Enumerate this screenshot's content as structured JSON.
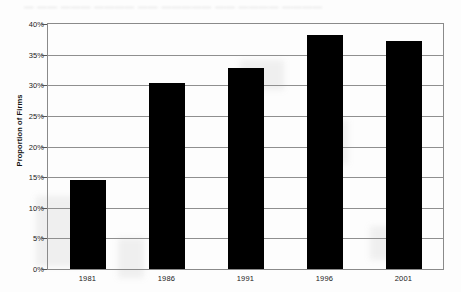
{
  "artifacts": {
    "bleed_through_text": "— —— ——— ———— —— ————— —— ———— ————"
  },
  "chart_data": {
    "type": "bar",
    "title": "",
    "xlabel": "",
    "ylabel": "Proportion of Firms",
    "categories": [
      "1981",
      "1986",
      "1991",
      "1996",
      "2001"
    ],
    "values": [
      14.5,
      30.3,
      32.8,
      38.2,
      37.2
    ],
    "value_unit": "%",
    "ylim": [
      0,
      40
    ],
    "ytick_values": [
      0,
      5,
      10,
      15,
      20,
      25,
      30,
      35,
      40
    ],
    "ytick_labels": [
      "0%",
      "5%",
      "10%",
      "15%",
      "20%",
      "25%",
      "30%",
      "35%",
      "40%"
    ],
    "grid": true,
    "grid_axis": "y",
    "legend": false,
    "bar_color": "#000000",
    "plot_border_color": "#8a8a8a",
    "gridline_color": "#8f8f8f"
  }
}
